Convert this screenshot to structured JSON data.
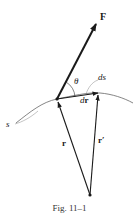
{
  "figure": {
    "caption": "Fig. 11–1",
    "labels": {
      "force": "F",
      "angle": "θ",
      "arc_length": "ds",
      "displacement_d": "d",
      "displacement_r": "r",
      "path": "s",
      "position": "r",
      "position_prime": "r′"
    },
    "colors": {
      "stroke": "#1a1a1a",
      "thin_stroke": "#555555",
      "background": "#ffffff"
    }
  }
}
